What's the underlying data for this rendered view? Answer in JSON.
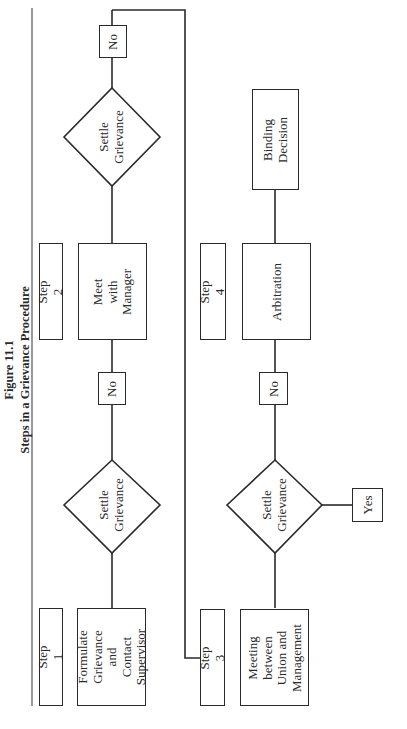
{
  "figure": {
    "number": "Figure 11.1",
    "title": "Steps in a Grievance Procedure",
    "orientation": "rotated 90 degrees counter-clockwise"
  },
  "steps": [
    {
      "label": "Step 1"
    },
    {
      "label": "Step 2"
    },
    {
      "label": "Step 3"
    },
    {
      "label": "Step 4"
    }
  ],
  "nodes": {
    "formulate": "Formulate\nGrievance\nand Contact\nSupervisor",
    "settle1": "Settle\nGrievance",
    "no1": "No",
    "meet_manager": "Meet with\nManager",
    "settle2": "Settle\nGrievance",
    "no2": "No",
    "meeting_union": "Meeting\nbetween\nUnion and\nManagement",
    "settle3": "Settle\nGrievance",
    "yes": "Yes",
    "no3": "No",
    "arbitration": "Arbitration",
    "binding": "Binding\nDecision"
  },
  "flow": [
    "Formulate Grievance and Contact Supervisor -> Settle Grievance",
    "Settle Grievance -> No -> Meet with Manager",
    "Meet with Manager -> Settle Grievance",
    "Settle Grievance -> No -> Meeting between Union and Management",
    "Meeting between Union and Management -> Settle Grievance",
    "Settle Grievance -> Yes",
    "Settle Grievance -> No -> Arbitration",
    "Arbitration -> Binding Decision"
  ],
  "colors": {
    "line": "#2a2a2a",
    "background": "#ffffff"
  }
}
